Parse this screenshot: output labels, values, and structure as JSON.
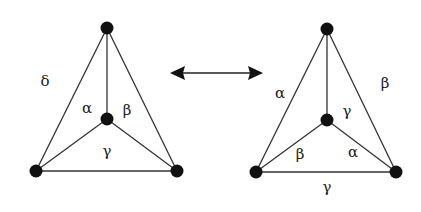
{
  "diagram": {
    "graphs": [
      {
        "id": "left",
        "vertices": [
          {
            "id": "top",
            "x": 107,
            "y": 28
          },
          {
            "id": "center",
            "x": 107,
            "y": 119
          },
          {
            "id": "bottom-left",
            "x": 36,
            "y": 171
          },
          {
            "id": "bottom-right",
            "x": 177,
            "y": 171
          }
        ],
        "labels": [
          {
            "text": "δ",
            "x": 45,
            "y": 82
          },
          {
            "text": "α",
            "x": 87,
            "y": 109
          },
          {
            "text": "β",
            "x": 127,
            "y": 111
          },
          {
            "text": "γ",
            "x": 107,
            "y": 152
          }
        ]
      },
      {
        "id": "right",
        "vertices": [
          {
            "id": "top",
            "x": 327,
            "y": 29
          },
          {
            "id": "center",
            "x": 327,
            "y": 120
          },
          {
            "id": "bottom-left",
            "x": 256,
            "y": 172
          },
          {
            "id": "bottom-right",
            "x": 396,
            "y": 172
          }
        ],
        "labels": [
          {
            "text": "α",
            "x": 280,
            "y": 94
          },
          {
            "text": "β",
            "x": 385,
            "y": 84
          },
          {
            "text": "γ",
            "x": 347,
            "y": 112
          },
          {
            "text": "β",
            "x": 300,
            "y": 155
          },
          {
            "text": "α",
            "x": 353,
            "y": 153
          },
          {
            "text": "γ",
            "x": 327,
            "y": 187
          }
        ]
      }
    ],
    "arrow": {
      "type": "double-headed",
      "x1": 170,
      "y1": 73,
      "x2": 263,
      "y2": 73
    }
  }
}
